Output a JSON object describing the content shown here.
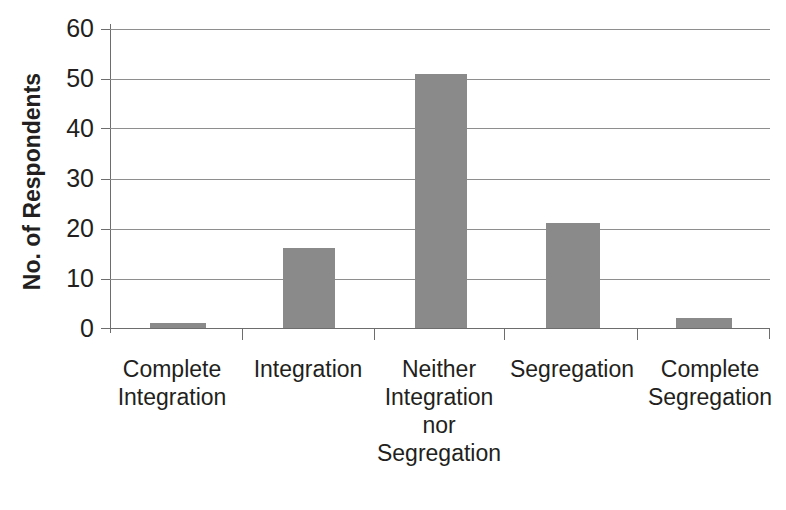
{
  "chart_data": {
    "type": "bar",
    "title": "",
    "xlabel": "",
    "ylabel": "No. of Respondents",
    "categories": [
      "Complete\nIntegration",
      "Integration",
      "Neither\nIntegration\nnor\nSegregation",
      "Segregation",
      "Complete\nSegregation"
    ],
    "values": [
      1,
      16,
      51,
      21,
      2
    ],
    "ylim": [
      0,
      60
    ],
    "yticks": [
      0,
      10,
      20,
      30,
      40,
      50,
      60
    ],
    "ytick_labels": [
      "0",
      "10",
      "20",
      "30",
      "40",
      "50",
      "60"
    ],
    "grid": true,
    "legend": false,
    "bar_color": "#8a8a8a",
    "axis_color": "#6d6d6d",
    "gridline_color": "#8e8e8e",
    "text_color": "#231f20"
  },
  "axis": {
    "y_title": "No. of Respondents"
  }
}
